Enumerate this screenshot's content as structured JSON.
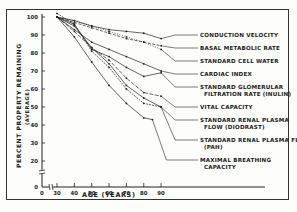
{
  "chart_data": {
    "type": "line",
    "title": "",
    "xlabel": "AGE (YEARS)",
    "ylabel": "PERCENT PROPERTY REMAINING",
    "ylabel_sub": "(AVERAGE)",
    "x_ticks": [
      0,
      30,
      40,
      50,
      60,
      70,
      80,
      90
    ],
    "y_ticks": [
      0,
      20,
      30,
      40,
      50,
      60,
      70,
      80,
      90,
      100
    ],
    "xlim": [
      0,
      90
    ],
    "ylim": [
      0,
      100
    ],
    "axis_breaks": {
      "x": "between 0 and 30",
      "y": "between 0 and 20"
    },
    "grid": false,
    "legend_position": "right, labels attached via leader lines",
    "series": [
      {
        "name": "CONDUCTION VELOCITY",
        "x": [
          30,
          40,
          50,
          60,
          70,
          80,
          90
        ],
        "values": [
          100,
          98,
          95,
          93,
          92,
          91,
          88
        ]
      },
      {
        "name": "BASAL METABOLIC RATE",
        "x": [
          30,
          40,
          50,
          60,
          70,
          80,
          90
        ],
        "values": [
          100,
          97,
          94,
          91,
          88,
          86,
          84
        ]
      },
      {
        "name": "STANDARD CELL WATER",
        "x": [
          30,
          40,
          50,
          60,
          70,
          80,
          90
        ],
        "values": [
          100,
          98,
          95,
          92,
          89,
          86,
          82
        ]
      },
      {
        "name": "CARDIAC INDEX",
        "x": [
          30,
          40,
          50,
          60,
          70,
          80,
          90
        ],
        "values": [
          100,
          93,
          86,
          82,
          78,
          74,
          70
        ]
      },
      {
        "name": "STANDARD GLOMERULAR FILTRATION RATE (INULIN)",
        "x": [
          30,
          40,
          50,
          60,
          70,
          80,
          90
        ],
        "values": [
          100,
          96,
          82,
          78,
          72,
          67,
          69
        ]
      },
      {
        "name": "VITAL CAPACITY",
        "x": [
          30,
          40,
          50,
          60,
          70,
          80,
          90
        ],
        "values": [
          100,
          92,
          83,
          76,
          66,
          58,
          56
        ]
      },
      {
        "name": "STANDARD RENAL PLASMA FLOW (DIODRAST)",
        "x": [
          30,
          40,
          50,
          60,
          70,
          80,
          90
        ],
        "values": [
          100,
          95,
          83,
          74,
          62,
          55,
          50
        ]
      },
      {
        "name": "STANDARD RENAL PLASMA FLOW (PAH)",
        "x": [
          30,
          40,
          50,
          60,
          70,
          80,
          90
        ],
        "values": [
          102,
          96,
          81,
          72,
          60,
          52,
          50
        ]
      },
      {
        "name": "MAXIMAL BREATHING CAPACITY",
        "x": [
          30,
          40,
          50,
          60,
          70,
          80,
          85
        ],
        "values": [
          100,
          89,
          75,
          62,
          52,
          44,
          43
        ]
      }
    ]
  },
  "labels": {
    "legend": [
      "CONDUCTION VELOCITY",
      "BASAL METABOLIC RATE",
      "STANDARD CELL WATER",
      "CARDIAC INDEX",
      "STANDARD GLOMERULAR",
      "FILTRATION RATE (INULIN)",
      "VITAL CAPACITY",
      "STANDARD RENAL PLASMA",
      "FLOW (DIODRAST)",
      "STANDARD RENAL PLASMA FLOW",
      "(PAH)",
      "MAXIMAL BREATHING",
      "CAPACITY"
    ],
    "ylabel": "PERCENT PROPERTY REMAINING",
    "ylabel_sub": "(AVERAGE)",
    "xlabel": "AGE (YEARS)"
  },
  "colors": {
    "ink": "#222222",
    "paper": "#fdfdfb"
  }
}
